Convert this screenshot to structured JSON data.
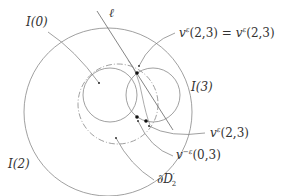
{
  "diagram": {
    "labels": {
      "i0": "I(0)",
      "ell": "ℓ",
      "v_top_left": "v",
      "v_top_left_sup": "ε",
      "v_top_args": "(2,3) = ",
      "v_top_right": "v",
      "v_top_right_sup": "ε",
      "v_top_right_args": "(2,3)",
      "i3": "I(3)",
      "i2": "I(2)",
      "v_mid": "v",
      "v_mid_sup": "ε",
      "v_mid_args": "(2,3)",
      "v_neg": "v",
      "v_neg_sup": "−ε",
      "v_neg_args": "(0,3)",
      "boundary": "∂D",
      "boundary_sup": "′",
      "boundary_sub": "2"
    },
    "colors": {
      "stroke": "#777777",
      "dot": "#111111",
      "text": "#333333"
    }
  }
}
